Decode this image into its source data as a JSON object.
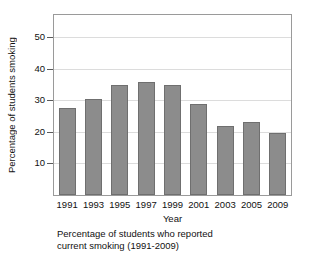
{
  "top_remnant_text": "",
  "chart_data": {
    "type": "bar",
    "title": "",
    "categories": [
      "1991",
      "1993",
      "1995",
      "1997",
      "1999",
      "2001",
      "2003",
      "2005",
      "2009"
    ],
    "values": [
      27.5,
      30.5,
      34.8,
      35.7,
      34.8,
      28.7,
      21.7,
      23.0,
      19.5
    ],
    "series": [
      {
        "name": "Percentage of students smoking",
        "values": [
          27.5,
          30.5,
          34.8,
          35.7,
          34.8,
          28.7,
          21.7,
          23.0,
          19.5
        ]
      }
    ],
    "xlabel": "Year",
    "ylabel": "Percentage of students smoking",
    "ylim": [
      0,
      57
    ],
    "yticks": [
      10,
      20,
      30,
      40,
      50
    ],
    "ytick_labels": [
      "10",
      "20",
      "30",
      "40",
      "50"
    ],
    "grid": true,
    "legend": false,
    "bar_color": "#8c8c8c",
    "bar_edge_color": "#6f6f6f",
    "gridline_color": "#dcdcdc",
    "frame_color": "#9a9a9a"
  },
  "caption": {
    "line1": "Percentage of students who reported",
    "line2": "current smoking (1991-2009)"
  }
}
